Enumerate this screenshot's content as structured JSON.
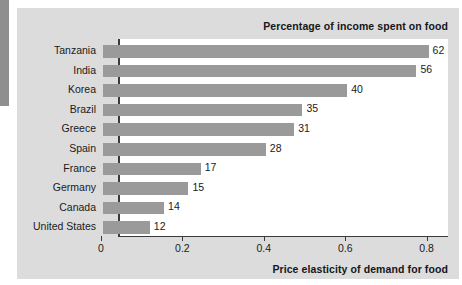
{
  "chart_data": {
    "type": "bar",
    "orientation": "horizontal",
    "title": "Percentage of income spent on food",
    "xlabel": "Price elasticity of demand for food",
    "ylabel": "",
    "xlim": [
      0,
      0.85
    ],
    "xticks": [
      "0",
      "0.2",
      "0.4",
      "0.6",
      "0.8"
    ],
    "xtick_values": [
      0,
      0.2,
      0.4,
      0.6,
      0.8
    ],
    "grid": false,
    "legend": "none",
    "bar_color": "#9a9a9a",
    "categories": [
      "Tanzania",
      "India",
      "Korea",
      "Brazil",
      "Greece",
      "Spain",
      "France",
      "Germany",
      "Canada",
      "United States"
    ],
    "values": [
      0.8,
      0.77,
      0.6,
      0.49,
      0.47,
      0.4,
      0.24,
      0.21,
      0.15,
      0.115
    ],
    "data_labels": [
      "62",
      "56",
      "40",
      "35",
      "31",
      "28",
      "17",
      "15",
      "14",
      "12"
    ],
    "data_label_meaning": "Percentage of income spent on food",
    "points": [
      {
        "category": "Tanzania",
        "elasticity": 0.8,
        "percent_income_on_food": 62
      },
      {
        "category": "India",
        "elasticity": 0.77,
        "percent_income_on_food": 56
      },
      {
        "category": "Korea",
        "elasticity": 0.6,
        "percent_income_on_food": 40
      },
      {
        "category": "Brazil",
        "elasticity": 0.49,
        "percent_income_on_food": 35
      },
      {
        "category": "Greece",
        "elasticity": 0.47,
        "percent_income_on_food": 31
      },
      {
        "category": "Spain",
        "elasticity": 0.4,
        "percent_income_on_food": 28
      },
      {
        "category": "France",
        "elasticity": 0.24,
        "percent_income_on_food": 17
      },
      {
        "category": "Germany",
        "elasticity": 0.21,
        "percent_income_on_food": 15
      },
      {
        "category": "Canada",
        "elasticity": 0.15,
        "percent_income_on_food": 14
      },
      {
        "category": "United States",
        "elasticity": 0.115,
        "percent_income_on_food": 12
      }
    ]
  }
}
